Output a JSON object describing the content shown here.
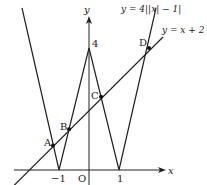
{
  "diagram": {
    "axes": {
      "x_label": "x",
      "y_label": "y",
      "origin_label": "O"
    },
    "ticks": {
      "x_neg1": "−1",
      "x_pos1": "1",
      "y_4": "4"
    },
    "curves": {
      "abs_curve": "y = 4||x| − 1|",
      "line": "y = x + 2"
    },
    "points": {
      "A": {
        "label": "A",
        "x": -1.2,
        "y": 0.8
      },
      "B": {
        "label": "B",
        "x": -0.6667,
        "y": 1.3333
      },
      "C": {
        "label": "C",
        "x": 0.4,
        "y": 2.4
      },
      "D": {
        "label": "D",
        "x": 2,
        "y": 4
      }
    },
    "colors": {
      "stroke": "#222222",
      "background": "#ffffff"
    }
  }
}
